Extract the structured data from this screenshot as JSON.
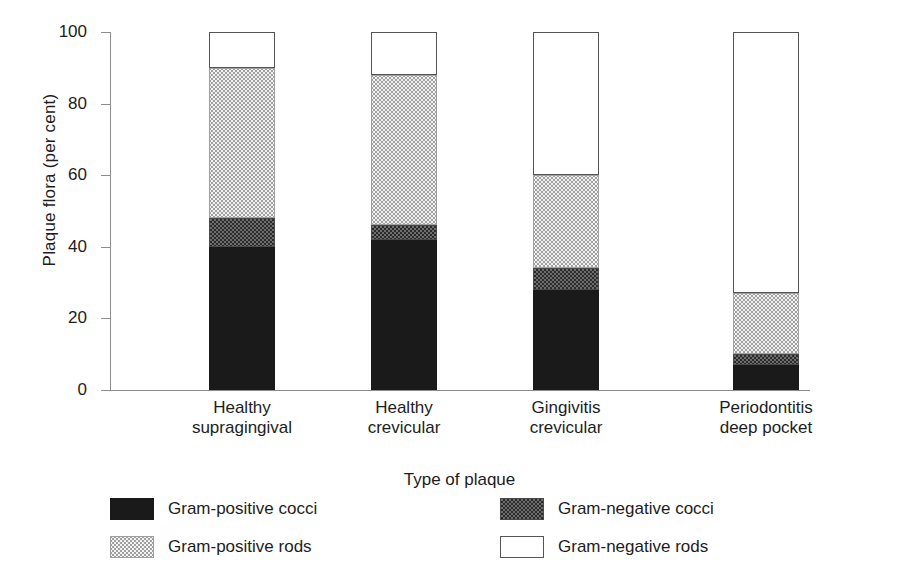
{
  "chart_data": {
    "type": "bar",
    "subtype": "stacked-bar-100-percent",
    "title": "",
    "xlabel": "Type of plaque",
    "ylabel": "Plaque flora (per cent)",
    "ylim": [
      0,
      100
    ],
    "yticks": [
      0,
      20,
      40,
      60,
      80,
      100
    ],
    "ytick_labels": [
      "0",
      "20",
      "40",
      "60",
      "80",
      "100"
    ],
    "grid": false,
    "legend_position": "bottom",
    "categories": [
      "Healthy supragingival",
      "Healthy crevicular",
      "Gingivitis crevicular",
      "Periodontitis deep pocket"
    ],
    "category_lines": [
      [
        "Healthy",
        "supragingival"
      ],
      [
        "Healthy",
        "crevicular"
      ],
      [
        "Gingivitis",
        "crevicular"
      ],
      [
        "Periodontitis",
        "deep pocket"
      ]
    ],
    "series": [
      {
        "name": "Gram-positive cocci",
        "key": "gpc",
        "fill": "solid-black",
        "values": [
          40,
          42,
          28,
          7
        ]
      },
      {
        "name": "Gram-negative cocci",
        "key": "gnc",
        "fill": "dark-checker",
        "values": [
          8,
          4,
          6,
          3
        ]
      },
      {
        "name": "Gram-positive rods",
        "key": "gpr",
        "fill": "light-dotted",
        "values": [
          42,
          42,
          26,
          17
        ]
      },
      {
        "name": "Gram-negative rods",
        "key": "gnr",
        "fill": "white-outline",
        "values": [
          10,
          12,
          40,
          73
        ]
      }
    ],
    "cumulative_boundaries": [
      [
        0,
        40,
        48,
        90,
        100
      ],
      [
        0,
        42,
        46,
        88,
        100
      ],
      [
        0,
        28,
        34,
        60,
        100
      ],
      [
        0,
        7,
        10,
        27,
        100
      ]
    ]
  },
  "legend": {
    "items": [
      {
        "label": "Gram-positive cocci",
        "swatch": "solid-black"
      },
      {
        "label": "Gram-negative cocci",
        "swatch": "dark-checker"
      },
      {
        "label": "Gram-positive rods",
        "swatch": "light-dotted"
      },
      {
        "label": "Gram-negative rods",
        "swatch": "white-outline"
      }
    ]
  },
  "colors": {
    "axis": "#8d8d8d",
    "text": "#1d1d1d",
    "gram_positive_cocci": "#1a1a1a",
    "gram_negative_cocci": "#6d6d6d",
    "gram_positive_rods": "#f2f2f2",
    "gram_negative_rods": "#ffffff",
    "background": "#ffffff"
  }
}
